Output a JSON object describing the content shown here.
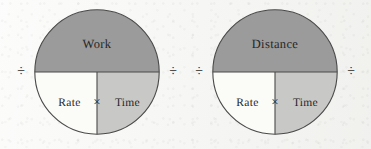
{
  "page": {
    "background_color": "#f6f6f4",
    "type": "formula-circle-diagrams"
  },
  "palette": {
    "top_half_fill": "#9b9b9b",
    "bottom_left_fill": "#fbfbf8",
    "bottom_right_fill": "#c8c8c6",
    "stroke": "#4a4a4a",
    "text": "#262626"
  },
  "symbols": {
    "divide": "÷",
    "multiply": "×"
  },
  "diagrams": [
    {
      "id": "work-diagram",
      "top_label": "Work",
      "bottom_left_label": "Rate",
      "bottom_right_label": "Time",
      "center_operator": "×",
      "left_operator": "÷",
      "right_operator": "÷"
    },
    {
      "id": "distance-diagram",
      "top_label": "Distance",
      "bottom_left_label": "Rate",
      "bottom_right_label": "Time",
      "center_operator": "×",
      "left_operator": "÷",
      "right_operator": "÷"
    }
  ]
}
